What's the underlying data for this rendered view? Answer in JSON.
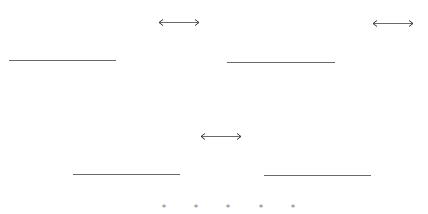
{
  "colors": {
    "stroke": "#6a6a6a",
    "star": "#777777",
    "background": "#ffffff"
  },
  "arrows": [
    {
      "id": "arrow-1",
      "x": 158,
      "y": 22,
      "width": 42,
      "icon": "double-arrow-icon"
    },
    {
      "id": "arrow-2",
      "x": 372,
      "y": 23,
      "width": 42,
      "icon": "double-arrow-icon"
    },
    {
      "id": "arrow-3",
      "x": 200,
      "y": 136,
      "width": 42,
      "icon": "double-arrow-icon"
    }
  ],
  "lines": [
    {
      "id": "line-1",
      "x": 9,
      "y": 60,
      "width": 107
    },
    {
      "id": "line-2",
      "x": 227,
      "y": 62,
      "width": 108
    },
    {
      "id": "line-3",
      "x": 73,
      "y": 174,
      "width": 107
    },
    {
      "id": "line-4",
      "x": 264,
      "y": 175,
      "width": 107
    }
  ],
  "stars": {
    "glyph": "*",
    "items": [
      {
        "x": 164,
        "y": 208
      },
      {
        "x": 196,
        "y": 208
      },
      {
        "x": 228,
        "y": 208
      },
      {
        "x": 261,
        "y": 208
      },
      {
        "x": 293,
        "y": 208
      }
    ]
  }
}
